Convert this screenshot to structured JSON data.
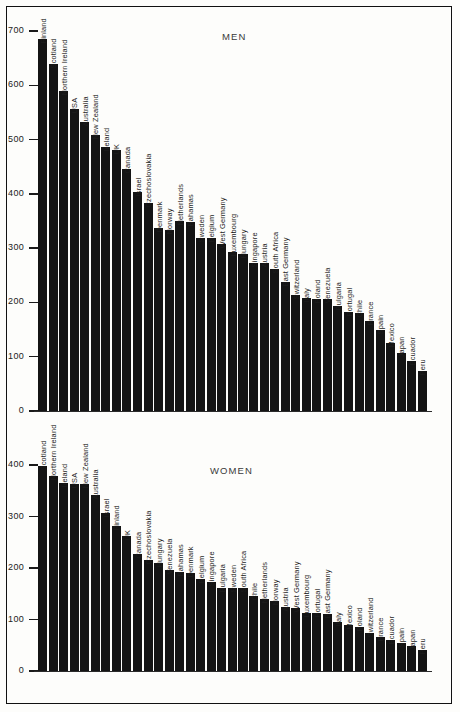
{
  "figure": {
    "background_color": "#fdfdfb",
    "bar_color": "#141414",
    "frame_color": "#111111"
  },
  "charts": {
    "men": {
      "title": "MEN",
      "ylim": [
        0,
        700
      ],
      "yticks": [
        "0",
        "100",
        "200",
        "300",
        "400",
        "500",
        "600",
        "700"
      ]
    },
    "women": {
      "title": "WOMEN",
      "ylim": [
        0,
        400
      ],
      "yticks": [
        "0",
        "100",
        "200",
        "300",
        "400"
      ]
    }
  },
  "chart_data": [
    {
      "type": "bar",
      "title": "MEN",
      "xlabel": "",
      "ylabel": "",
      "ylim": [
        0,
        700
      ],
      "yticks": [
        0,
        100,
        200,
        300,
        400,
        500,
        600,
        700
      ],
      "grid": false,
      "legend": "none",
      "orientation": "vertical",
      "categories": [
        "Finland",
        "Scotland",
        "Northern Ireland",
        "USA",
        "Australia",
        "New Zealand",
        "Ireland",
        "UK",
        "Canada",
        "Israel",
        "Czechoslovakia",
        "Denmark",
        "Norway",
        "Netherlands",
        "Bahamas",
        "Sweden",
        "Belgium",
        "West Germany",
        "Luxembourg",
        "Hungary",
        "Singapore",
        "Austria",
        "South Africa",
        "East Germany",
        "Switzerland",
        "Italy",
        "Poland",
        "Venezuela",
        "Bulgaria",
        "Portugal",
        "Chile",
        "France",
        "Spain",
        "Mexico",
        "Japan",
        "Ecuador",
        "Peru"
      ],
      "values": [
        685,
        640,
        590,
        556,
        532,
        509,
        487,
        481,
        445,
        403,
        383,
        337,
        334,
        350,
        349,
        319,
        318,
        308,
        292,
        289,
        272,
        272,
        261,
        238,
        213,
        209,
        207,
        206,
        194,
        183,
        181,
        166,
        150,
        126,
        107,
        92,
        74
      ]
    },
    {
      "type": "bar",
      "title": "WOMEN",
      "xlabel": "",
      "ylabel": "",
      "ylim": [
        0,
        400
      ],
      "yticks": [
        0,
        100,
        200,
        300,
        400
      ],
      "grid": false,
      "legend": "none",
      "orientation": "vertical",
      "categories": [
        "Scotland",
        "Northern Ireland",
        "Ireland",
        "USA",
        "New Zealand",
        "Australia",
        "Israel",
        "Finland",
        "UK",
        "Canada",
        "Czechoslovakia",
        "Hungary",
        "Venezuela",
        "Bahamas",
        "Denmark",
        "Belgium",
        "Singapore",
        "Bulgaria",
        "Sweden",
        "South Africa",
        "Chile",
        "Netherlands",
        "Norway",
        "Austria",
        "West Germany",
        "Luxembourg",
        "Portugal",
        "East Germany",
        "Italy",
        "Mexico",
        "Poland",
        "Switzerland",
        "France",
        "Ecuador",
        "Spain",
        "Japan",
        "Peru"
      ],
      "values": [
        399,
        378,
        366,
        364,
        364,
        342,
        306,
        282,
        262,
        228,
        216,
        209,
        196,
        193,
        190,
        178,
        173,
        162,
        162,
        161,
        146,
        139,
        135,
        124,
        122,
        113,
        112,
        110,
        95,
        90,
        86,
        73,
        66,
        60,
        54,
        49,
        41
      ]
    }
  ]
}
